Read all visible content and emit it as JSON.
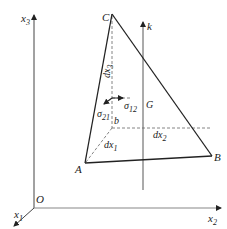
{
  "diagram": {
    "type": "stress-tetrahedron",
    "colors": {
      "line": "#222222",
      "dashed": "#555555",
      "background": "#ffffff"
    },
    "axes": {
      "x1": {
        "label": "x",
        "sub": "1"
      },
      "x2": {
        "label": "x",
        "sub": "2"
      },
      "x3": {
        "label": "x",
        "sub": "3"
      },
      "origin": {
        "label": "O"
      }
    },
    "points": {
      "A": {
        "label": "A"
      },
      "B": {
        "label": "B"
      },
      "C": {
        "label": "C"
      },
      "b": {
        "label": "b"
      },
      "G": {
        "label": "G"
      }
    },
    "normal": {
      "label": "k"
    },
    "edges": {
      "dx1": {
        "label": "dx",
        "sub": "1"
      },
      "dx2": {
        "label": "dx",
        "sub": "2"
      },
      "dx3": {
        "label": "dx",
        "sub": "3"
      }
    },
    "stresses": {
      "sigma12": {
        "label": "σ",
        "sub": "12"
      },
      "sigma21": {
        "label": "σ",
        "sub": "21"
      }
    }
  }
}
